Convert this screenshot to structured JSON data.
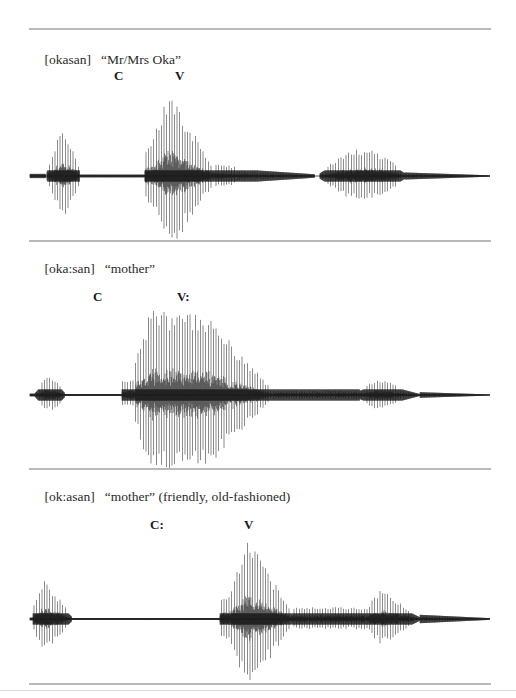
{
  "figure": {
    "panels": [
      {
        "transcription": "[okasan]",
        "gloss": "“Mr/Mrs Oka”",
        "labels": [
          {
            "text": "C",
            "x": 114
          },
          {
            "text": "V",
            "x": 175
          }
        ],
        "geometry": {
          "rule_y": 28,
          "caption_y": 38,
          "label_y": 68,
          "wave_top": 80,
          "wave_height": 160,
          "baseline": 176
        },
        "envelope": [
          {
            "x0": 30,
            "x1": 46,
            "amp": 3,
            "dense": 0.9,
            "shape": "flat"
          },
          {
            "x0": 47,
            "x1": 80,
            "amp": 43,
            "dense": 1,
            "shape": "bell"
          },
          {
            "x0": 80,
            "x1": 145,
            "amp": 2,
            "dense": 0.6,
            "shape": "flat"
          },
          {
            "x0": 145,
            "x1": 150,
            "amp": 30,
            "dense": 1,
            "shape": "flat"
          },
          {
            "x0": 150,
            "x1": 215,
            "amp": 85,
            "dense": 1,
            "shape": "peak-early"
          },
          {
            "x0": 215,
            "x1": 315,
            "amp": 12,
            "dense": 1,
            "shape": "decay"
          },
          {
            "x0": 320,
            "x1": 405,
            "amp": 27,
            "dense": 1,
            "shape": "bell"
          },
          {
            "x0": 405,
            "x1": 490,
            "amp": 5,
            "dense": 0.8,
            "shape": "decay"
          }
        ]
      },
      {
        "transcription": "[oka:san]",
        "gloss": "“mother”",
        "labels": [
          {
            "text": "C",
            "x": 93
          },
          {
            "text": "V:",
            "x": 177
          }
        ],
        "geometry": {
          "rule_y": 240,
          "caption_y": 246,
          "label_y": 291,
          "wave_top": 300,
          "wave_height": 170,
          "baseline": 395
        },
        "envelope": [
          {
            "x0": 30,
            "x1": 35,
            "amp": 2,
            "dense": 0.8,
            "shape": "flat"
          },
          {
            "x0": 35,
            "x1": 65,
            "amp": 18,
            "dense": 1,
            "shape": "bell"
          },
          {
            "x0": 65,
            "x1": 122,
            "amp": 1.5,
            "dense": 0.6,
            "shape": "flat"
          },
          {
            "x0": 122,
            "x1": 135,
            "amp": 15,
            "dense": 1,
            "shape": "flat"
          },
          {
            "x0": 135,
            "x1": 270,
            "amp": 88,
            "dense": 1,
            "shape": "plateau"
          },
          {
            "x0": 270,
            "x1": 360,
            "amp": 8,
            "dense": 1,
            "shape": "flat"
          },
          {
            "x0": 360,
            "x1": 420,
            "amp": 17,
            "dense": 1,
            "shape": "peak-early"
          },
          {
            "x0": 420,
            "x1": 490,
            "amp": 4,
            "dense": 0.8,
            "shape": "decay"
          }
        ]
      },
      {
        "transcription": "[ok:asan]",
        "gloss": "“mother” (friendly, old-fashioned)",
        "labels": [
          {
            "text": "C:",
            "x": 150
          },
          {
            "text": "V",
            "x": 244
          }
        ],
        "geometry": {
          "rule_y": 468,
          "caption_y": 474,
          "label_y": 519,
          "wave_top": 530,
          "wave_height": 150,
          "baseline": 619
        },
        "envelope": [
          {
            "x0": 30,
            "x1": 33,
            "amp": 2,
            "dense": 0.8,
            "shape": "flat"
          },
          {
            "x0": 33,
            "x1": 72,
            "amp": 40,
            "dense": 1,
            "shape": "peak-early"
          },
          {
            "x0": 72,
            "x1": 220,
            "amp": 1.5,
            "dense": 0.6,
            "shape": "flat"
          },
          {
            "x0": 220,
            "x1": 230,
            "amp": 22,
            "dense": 1,
            "shape": "flat"
          },
          {
            "x0": 230,
            "x1": 292,
            "amp": 82,
            "dense": 1,
            "shape": "peak-early"
          },
          {
            "x0": 292,
            "x1": 365,
            "amp": 12,
            "dense": 1,
            "shape": "flat"
          },
          {
            "x0": 365,
            "x1": 420,
            "amp": 30,
            "dense": 1,
            "shape": "peak-early"
          },
          {
            "x0": 420,
            "x1": 490,
            "amp": 6,
            "dense": 0.8,
            "shape": "decay"
          }
        ]
      }
    ],
    "bottom_rule_y": 683,
    "page_edge_y": 690
  }
}
